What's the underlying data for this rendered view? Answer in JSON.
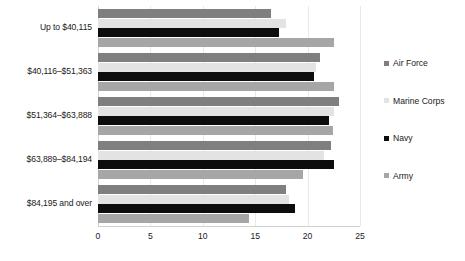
{
  "chart_data": {
    "type": "bar",
    "orientation": "horizontal",
    "title": "",
    "subtitle": "",
    "xlabel": "",
    "ylabel": "",
    "xlim": [
      0,
      25
    ],
    "xticks": [
      0,
      5,
      10,
      15,
      20,
      25
    ],
    "xtick_labels": [
      "0",
      "5",
      "10",
      "15",
      "20",
      "25"
    ],
    "grid": true,
    "legend_position": "right",
    "categories": [
      "Up to $40,115",
      "$40,116–$51,363",
      "$51,364–$63,888",
      "$63,889–$84,194",
      "$84,195 and over"
    ],
    "series": [
      {
        "name": "Air Force",
        "color": "#7f7f7f",
        "values": [
          16.5,
          21.2,
          23.0,
          22.2,
          17.9
        ]
      },
      {
        "name": "Marine Corps",
        "color": "#e3e3e3",
        "values": [
          17.9,
          20.8,
          22.5,
          21.6,
          18.2
        ]
      },
      {
        "name": "Navy",
        "color": "#0d0d0d",
        "values": [
          17.3,
          20.6,
          22.0,
          22.5,
          18.8
        ]
      },
      {
        "name": "Army",
        "color": "#a6a6a6",
        "values": [
          22.5,
          22.5,
          22.4,
          19.6,
          14.4
        ]
      }
    ]
  },
  "legend": {
    "items": [
      {
        "label": "Air Force",
        "color": "#7f7f7f"
      },
      {
        "label": "Marine Corps",
        "color": "#e3e3e3"
      },
      {
        "label": "Navy",
        "color": "#0d0d0d"
      },
      {
        "label": "Army",
        "color": "#a6a6a6"
      }
    ]
  }
}
